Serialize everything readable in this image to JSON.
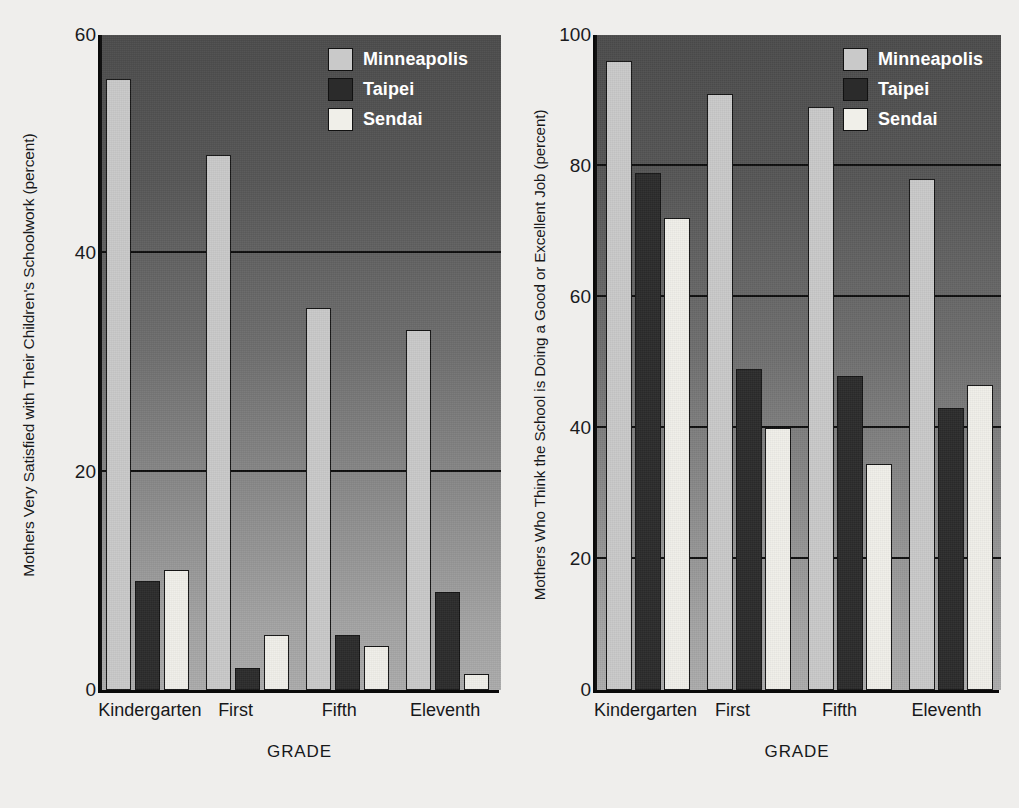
{
  "figure": {
    "background_color": "#efeeec"
  },
  "colors": {
    "minneapolis": "#c9c9c9",
    "taipei": "#2b2b2b",
    "sendai": "#f0efe9",
    "axis": "#0a0a0a",
    "legend_text": "#ffffff",
    "label_text": "#17181a"
  },
  "chart_data": [
    {
      "type": "bar",
      "panel": "left",
      "title": "",
      "xlabel": "GRADE",
      "ylabel": "Mothers Very Satisfied with Their Children's Schoolwork (percent)",
      "categories": [
        "Kindergarten",
        "First",
        "Fifth",
        "Eleventh"
      ],
      "series": [
        {
          "name": "Minneapolis",
          "color": "#c9c9c9",
          "values": [
            56,
            49,
            35,
            33
          ]
        },
        {
          "name": "Taipei",
          "color": "#2b2b2b",
          "values": [
            10,
            2,
            5,
            9
          ]
        },
        {
          "name": "Sendai",
          "color": "#f0efe9",
          "values": [
            11,
            5,
            4,
            1.5
          ]
        }
      ],
      "ylim": [
        0,
        60
      ],
      "yticks": [
        0,
        20,
        40,
        60
      ],
      "grid": true,
      "gridlines_at": [
        20,
        40
      ],
      "legend_position": "top-right",
      "legend": [
        "Minneapolis",
        "Taipei",
        "Sendai"
      ]
    },
    {
      "type": "bar",
      "panel": "right",
      "title": "",
      "xlabel": "GRADE",
      "ylabel": "Mothers Who Think the School is Doing a Good or Excellent Job (percent)",
      "categories": [
        "Kindergarten",
        "First",
        "Fifth",
        "Eleventh"
      ],
      "series": [
        {
          "name": "Minneapolis",
          "color": "#c9c9c9",
          "values": [
            96,
            91,
            89,
            78
          ]
        },
        {
          "name": "Taipei",
          "color": "#2b2b2b",
          "values": [
            79,
            49,
            48,
            43
          ]
        },
        {
          "name": "Sendai",
          "color": "#f0efe9",
          "values": [
            72,
            40,
            34.5,
            46.5
          ]
        }
      ],
      "ylim": [
        0,
        100
      ],
      "yticks": [
        0,
        20,
        40,
        60,
        80,
        100
      ],
      "grid": true,
      "gridlines_at": [
        20,
        40,
        60,
        80
      ],
      "legend_position": "top-right",
      "legend": [
        "Minneapolis",
        "Taipei",
        "Sendai"
      ]
    }
  ]
}
